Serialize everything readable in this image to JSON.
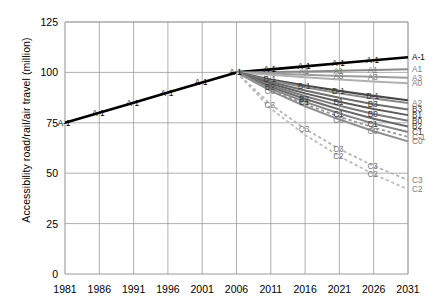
{
  "chart_data": {
    "type": "line",
    "title": "",
    "xlabel": "",
    "ylabel": "Accessibility road/rail/air travel (million)",
    "xlim": [
      1981,
      2031
    ],
    "ylim": [
      0,
      125
    ],
    "xticks": [
      "1981",
      "1986",
      "1991",
      "1996",
      "2001",
      "2006",
      "2011",
      "2016",
      "2021",
      "2026",
      "2031"
    ],
    "yticks": [
      "0",
      "25",
      "50",
      "75",
      "100",
      "125"
    ],
    "grid": true,
    "legend_position": "inline-end-labels",
    "x": [
      1981,
      1986,
      1991,
      1996,
      2001,
      2006,
      2011,
      2016,
      2021,
      2026,
      2031
    ],
    "series": [
      {
        "name": "A-1",
        "style": "solid",
        "color": "#000000",
        "width": 2.6,
        "values": [
          75,
          80,
          85,
          90,
          95,
          100,
          101.5,
          103,
          104.5,
          106,
          107.5
        ],
        "labels_at": [
          1981,
          1986,
          1991,
          1996,
          2001,
          2006,
          2011,
          2016,
          2021,
          2026,
          2031
        ]
      },
      {
        "name": "A1",
        "style": "solid",
        "color": "#8a8a8a",
        "width": 2.0,
        "values": [
          null,
          null,
          null,
          null,
          null,
          100,
          100.2,
          100.5,
          100.8,
          101.2,
          101.6
        ],
        "labels_at": [
          2016,
          2021,
          2026,
          2031
        ]
      },
      {
        "name": "A3",
        "style": "solid",
        "color": "#9d9d9d",
        "width": 2.0,
        "values": [
          null,
          null,
          null,
          null,
          null,
          100,
          99.4,
          98.8,
          98.2,
          97.8,
          97.4
        ],
        "labels_at": [
          2021,
          2026,
          2031
        ]
      },
      {
        "name": "A0",
        "style": "solid",
        "color": "#b0b0b0",
        "width": 2.0,
        "values": [
          null,
          null,
          null,
          null,
          null,
          100,
          98.8,
          97.6,
          96.5,
          95.5,
          94.6
        ],
        "labels_at": [
          2031
        ]
      },
      {
        "name": "B-1",
        "style": "solid",
        "color": "#4a4a4a",
        "width": 2.2,
        "values": [
          null,
          null,
          null,
          null,
          null,
          100,
          96.5,
          93.5,
          90.8,
          88.4,
          86.2
        ],
        "labels_at": [
          2011,
          2016,
          2021,
          2026
        ]
      },
      {
        "name": "A2",
        "style": "solid",
        "color": "#8a8a8a",
        "width": 2.0,
        "values": [
          null,
          null,
          null,
          null,
          null,
          100,
          96.0,
          92.6,
          89.6,
          87.0,
          84.8
        ],
        "labels_at": [
          2031
        ]
      },
      {
        "name": "B3",
        "style": "solid",
        "color": "#6e6e6e",
        "width": 2.0,
        "values": [
          null,
          null,
          null,
          null,
          null,
          100,
          95.2,
          91.0,
          87.4,
          84.2,
          81.6
        ],
        "labels_at": [
          2026,
          2031
        ]
      },
      {
        "name": "B1",
        "style": "solid",
        "color": "#5c5c5c",
        "width": 2.0,
        "values": [
          null,
          null,
          null,
          null,
          null,
          100,
          94.4,
          89.6,
          85.4,
          81.8,
          78.8
        ],
        "labels_at": [
          2021,
          2031
        ]
      },
      {
        "name": "B0",
        "style": "solid",
        "color": "#7c7c7c",
        "width": 2.0,
        "values": [
          null,
          null,
          null,
          null,
          null,
          100,
          93.6,
          88.2,
          83.5,
          79.4,
          76.0
        ],
        "labels_at": [
          2026,
          2031
        ]
      },
      {
        "name": "B2",
        "style": "solid",
        "color": "#6a6a6a",
        "width": 2.0,
        "values": [
          null,
          null,
          null,
          null,
          null,
          100,
          92.8,
          86.8,
          81.6,
          77.0,
          73.2
        ],
        "labels_at": [
          2011,
          2016,
          2031
        ]
      },
      {
        "name": "C1",
        "style": "solid",
        "color": "#858585",
        "width": 2.0,
        "values": [
          null,
          null,
          null,
          null,
          null,
          100,
          92.0,
          85.4,
          79.6,
          74.6,
          70.4
        ],
        "labels_at": [
          2016,
          2021,
          2026,
          2031
        ]
      },
      {
        "name": "C-1",
        "style": "dashed",
        "color": "#9a9a9a",
        "width": 1.8,
        "values": [
          null,
          null,
          null,
          null,
          null,
          100,
          91.4,
          84.2,
          78.0,
          72.6,
          68.0
        ],
        "labels_at": [
          2031
        ]
      },
      {
        "name": "C0",
        "style": "solid",
        "color": "#909090",
        "width": 2.0,
        "values": [
          null,
          null,
          null,
          null,
          null,
          100,
          90.8,
          83.2,
          76.6,
          70.8,
          65.8
        ],
        "labels_at": [
          2011,
          2021,
          2026,
          2031
        ]
      },
      {
        "name": "C3",
        "style": "dashed",
        "color": "#b4b4b4",
        "width": 1.8,
        "values": [
          null,
          null,
          null,
          null,
          null,
          100,
          84.0,
          72.0,
          62.0,
          53.6,
          46.6
        ],
        "labels_at": [
          2011,
          2016,
          2021,
          2026,
          2031
        ]
      },
      {
        "name": "C2",
        "style": "dashed",
        "color": "#bcbcbc",
        "width": 1.8,
        "values": [
          null,
          null,
          null,
          null,
          null,
          100,
          82.0,
          69.0,
          58.4,
          49.4,
          42.0
        ],
        "labels_at": [
          2021,
          2026,
          2031
        ]
      }
    ]
  }
}
